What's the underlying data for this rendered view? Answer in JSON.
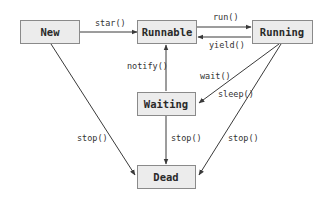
{
  "diagram": {
    "colors": {
      "box_fill": "#ececec",
      "box_border": "#8a8a8a",
      "arrow": "#3a3a3a",
      "text": "#2a2a2a"
    },
    "states": {
      "new": "New",
      "runnable": "Runnable",
      "running": "Running",
      "waiting": "Waiting",
      "dead": "Dead"
    },
    "transitions": {
      "new_to_runnable": "star()",
      "runnable_to_running": "run()",
      "running_to_runnable": "yield()",
      "running_to_waiting_wait": "wait()",
      "running_to_waiting_sleep": "sleep()",
      "waiting_to_runnable": "notify()",
      "new_to_dead": "stop()",
      "waiting_to_dead": "stop()",
      "running_to_dead": "stop()"
    }
  }
}
